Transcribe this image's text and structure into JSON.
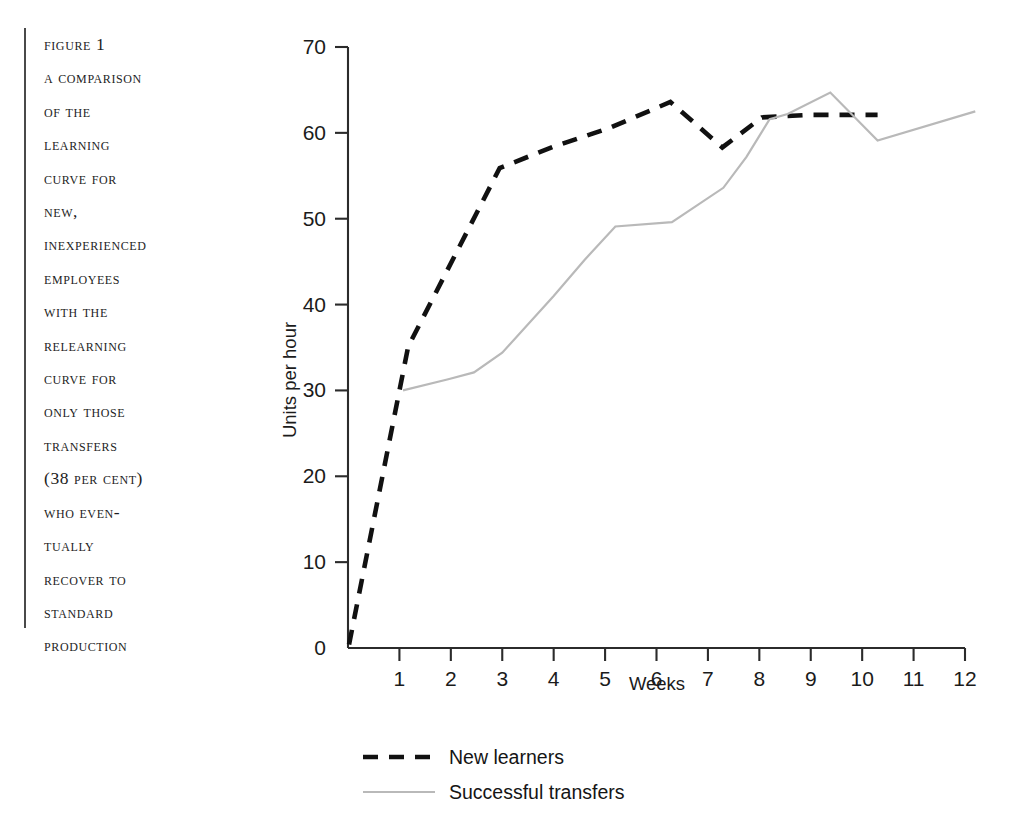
{
  "running_head": "",
  "caption": {
    "lines": [
      "Figure 1",
      "A Comparison",
      "of the",
      "Learning",
      "Curve for",
      "New,",
      "Inexperienced",
      "Employees",
      "with the",
      "Relearning",
      "Curve for",
      "Only Those",
      "Transfers",
      "(38 Per Cent)",
      "Who Even-",
      "tually",
      "Recover to",
      "Standard",
      "Production"
    ]
  },
  "chart_data": {
    "type": "line",
    "title": "",
    "xlabel": "Weeks",
    "ylabel": "Units per hour",
    "xlim": [
      0,
      12
    ],
    "ylim": [
      0,
      70
    ],
    "xticks": [
      0,
      1,
      2,
      3,
      4,
      5,
      6,
      7,
      8,
      9,
      10,
      11,
      12
    ],
    "xtick_labels": [
      "0",
      "1",
      "2",
      "3",
      "4",
      "5",
      "6",
      "7",
      "8",
      "9",
      "10",
      "11",
      "12"
    ],
    "yticks": [
      0,
      10,
      20,
      30,
      40,
      50,
      60,
      70
    ],
    "ytick_labels": [
      "0",
      "10",
      "20",
      "30",
      "40",
      "50",
      "60",
      "70"
    ],
    "grid": false,
    "legend_position": "below-plot",
    "series": [
      {
        "name": "New learners",
        "style": "dashed",
        "color": "#111111",
        "points": [
          [
            0.02,
            0.4
          ],
          [
            1.17,
            35.1
          ],
          [
            2.95,
            55.9
          ],
          [
            4.0,
            58.4
          ],
          [
            5.1,
            60.6
          ],
          [
            6.27,
            63.6
          ],
          [
            7.28,
            58.3
          ],
          [
            8.05,
            61.8
          ],
          [
            9.0,
            62.1
          ],
          [
            10.3,
            62.1
          ]
        ]
      },
      {
        "name": "Successful transfers",
        "style": "solid",
        "color": "#b9b9b9",
        "points": [
          [
            1.07,
            30.0
          ],
          [
            1.95,
            31.3
          ],
          [
            2.45,
            32.1
          ],
          [
            3.0,
            34.4
          ],
          [
            4.0,
            41.0
          ],
          [
            4.6,
            45.2
          ],
          [
            5.2,
            49.1
          ],
          [
            6.3,
            49.6
          ],
          [
            7.3,
            53.6
          ],
          [
            7.75,
            57.2
          ],
          [
            8.2,
            61.6
          ],
          [
            8.55,
            62.2
          ],
          [
            9.38,
            64.7
          ],
          [
            10.3,
            59.1
          ],
          [
            12.2,
            62.5
          ]
        ]
      }
    ],
    "legend": [
      {
        "label": "New learners",
        "style": "dashed",
        "color": "#111111"
      },
      {
        "label": "Successful transfers",
        "style": "solid",
        "color": "#b9b9b9"
      }
    ]
  }
}
